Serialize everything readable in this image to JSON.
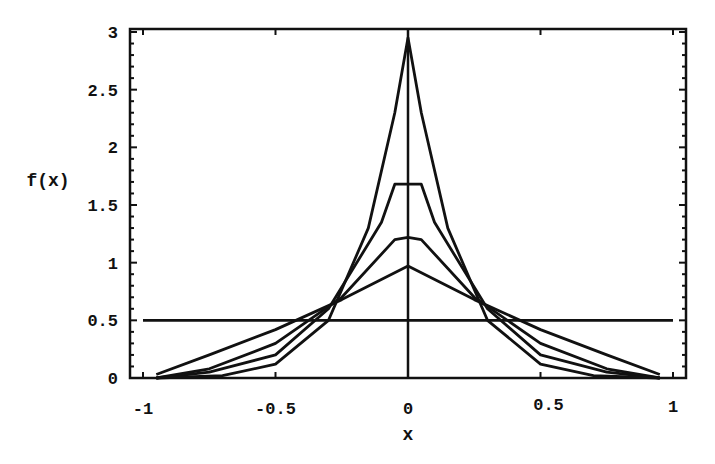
{
  "chart_data": {
    "type": "line",
    "title": "",
    "xlabel": "x",
    "ylabel": "f(x)",
    "xlim": [
      -1,
      1
    ],
    "ylim": [
      0,
      3
    ],
    "x_ticks": [
      "-1",
      "-0.5",
      "0",
      "0.5",
      "1"
    ],
    "y_ticks": [
      "0",
      "0.5",
      "1",
      "1.5",
      "2",
      "2.5",
      "3"
    ],
    "grid": false,
    "legend": null,
    "series": [
      {
        "name": "uniform",
        "x": [
          -1,
          1
        ],
        "values": [
          0.5,
          0.5
        ]
      },
      {
        "name": "peak 0.97",
        "x": [
          -0.95,
          -0.75,
          -0.5,
          -0.25,
          0,
          0.25,
          0.5,
          0.75,
          0.95
        ],
        "values": [
          0.03,
          0.2,
          0.42,
          0.68,
          0.97,
          0.68,
          0.42,
          0.2,
          0.03
        ]
      },
      {
        "name": "peak 1.22",
        "x": [
          -0.95,
          -0.75,
          -0.5,
          -0.25,
          -0.05,
          0,
          0.05,
          0.25,
          0.5,
          0.75,
          0.95
        ],
        "values": [
          0.0,
          0.08,
          0.3,
          0.7,
          1.2,
          1.22,
          1.2,
          0.7,
          0.3,
          0.08,
          0.0
        ]
      },
      {
        "name": "peak 1.68",
        "x": [
          -0.95,
          -0.75,
          -0.5,
          -0.3,
          -0.1,
          -0.05,
          0.05,
          0.1,
          0.3,
          0.5,
          0.75,
          0.95
        ],
        "values": [
          0.0,
          0.05,
          0.2,
          0.6,
          1.35,
          1.68,
          1.68,
          1.35,
          0.6,
          0.2,
          0.05,
          0.0
        ]
      },
      {
        "name": "peak 2.95",
        "x": [
          -0.95,
          -0.7,
          -0.5,
          -0.3,
          -0.15,
          -0.05,
          0,
          0.05,
          0.15,
          0.3,
          0.5,
          0.7,
          0.95
        ],
        "values": [
          0.0,
          0.02,
          0.12,
          0.5,
          1.3,
          2.3,
          2.95,
          2.3,
          1.3,
          0.5,
          0.12,
          0.02,
          0.0
        ]
      }
    ]
  }
}
